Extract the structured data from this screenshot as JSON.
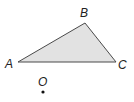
{
  "diagram": {
    "type": "geometry-triangle",
    "colors": {
      "fill": "#e2e2e2",
      "stroke": "#4a4a4a",
      "text": "#222222",
      "point": "#111111"
    },
    "points": {
      "A": {
        "label": "A",
        "x": 18,
        "y": 62
      },
      "B": {
        "label": "B",
        "x": 85,
        "y": 23
      },
      "C": {
        "label": "C",
        "x": 116,
        "y": 62
      },
      "O": {
        "label": "O",
        "x": 43,
        "y": 92
      }
    },
    "labels": {
      "A": "A",
      "B": "B",
      "C": "C",
      "O": "O"
    }
  }
}
